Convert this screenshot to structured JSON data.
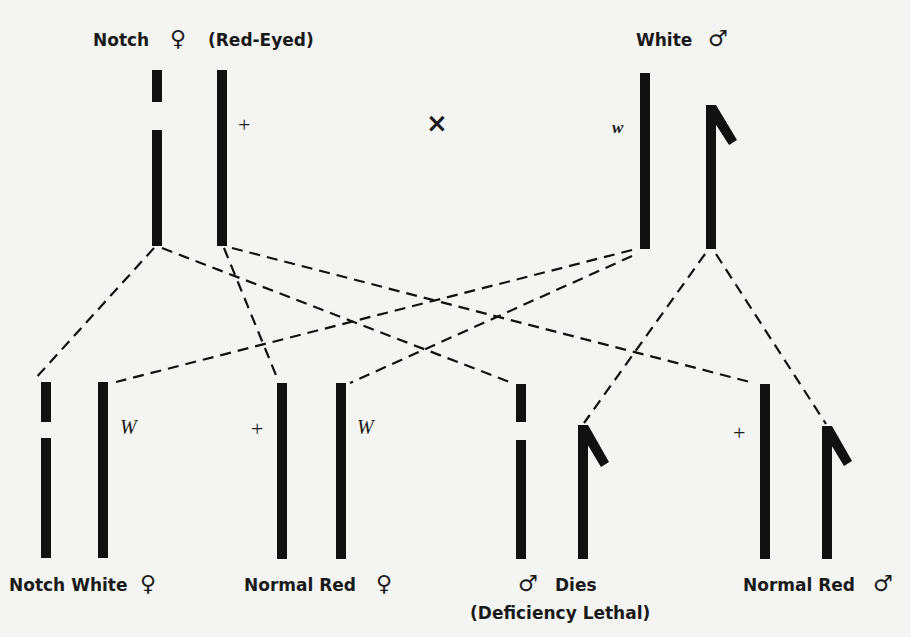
{
  "parents": {
    "female": {
      "name": "Notch",
      "sex_symbol": "♀",
      "phenotype": "(Red-Eyed)",
      "chromosome_allele": "+"
    },
    "cross_symbol": "×",
    "male": {
      "name": "White",
      "sex_symbol": "♂",
      "chromosome_allele": "w"
    }
  },
  "offspring": [
    {
      "label": "Notch White",
      "sex_symbol": "♀",
      "allele": "W"
    },
    {
      "label": "Normal Red",
      "sex_symbol": "♀",
      "allele_left": "+",
      "allele_right": "W"
    },
    {
      "label": "Dies",
      "sex_symbol": "♂",
      "note": "(Deficiency Lethal)"
    },
    {
      "label": "Normal Red",
      "sex_symbol": "♂",
      "allele": "+"
    }
  ],
  "colors": {
    "background": "#f4f4f2",
    "ink": "#111111"
  }
}
